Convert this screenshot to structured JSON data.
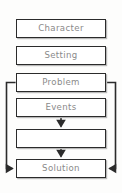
{
  "diagram": {
    "background_color": "#fdfdfc",
    "box_fill": "#ffffff",
    "box_border_color": "#2b2b2b",
    "box_shadow_color": "#b9b9b9",
    "label_color": "#8a8a8a",
    "connector_color": "#2b2b2b",
    "nodes": [
      {
        "id": "character",
        "label": "Character",
        "x": 16,
        "y": 19,
        "w": 90,
        "h": 19
      },
      {
        "id": "setting",
        "label": "Setting",
        "x": 16,
        "y": 46,
        "w": 90,
        "h": 19
      },
      {
        "id": "problem",
        "label": "Problem",
        "x": 16,
        "y": 73,
        "w": 90,
        "h": 19
      },
      {
        "id": "events",
        "label": "Events",
        "x": 16,
        "y": 98,
        "w": 90,
        "h": 19
      },
      {
        "id": "blank",
        "label": "",
        "x": 16,
        "y": 129,
        "w": 90,
        "h": 19
      },
      {
        "id": "solution",
        "label": "Solution",
        "x": 16,
        "y": 159,
        "w": 90,
        "h": 19
      }
    ],
    "connectors": [
      {
        "id": "events-to-blank",
        "from": "events",
        "to": "blank",
        "kind": "arrow-down"
      },
      {
        "id": "blank-to-solution",
        "from": "blank",
        "to": "solution",
        "kind": "arrow-down"
      },
      {
        "id": "problem-left-loop",
        "from": "problem",
        "to": "solution",
        "kind": "loop-left"
      },
      {
        "id": "problem-right-loop",
        "from": "problem",
        "to": "solution",
        "kind": "loop-right"
      }
    ]
  }
}
